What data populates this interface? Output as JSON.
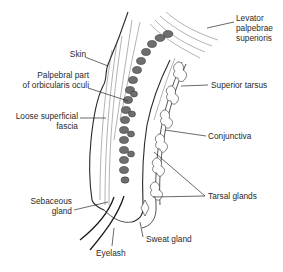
{
  "diagram": {
    "labels": {
      "skin": "Skin",
      "palpebral_part_line1": "Palpebral part",
      "palpebral_part_line2": "of orbicularis oculi",
      "loose_fascia_line1": "Loose superficial",
      "loose_fascia_line2": "fascia",
      "levator_line1": "Levator",
      "levator_line2": "palpebrae",
      "levator_line3": "superioris",
      "superior_tarsus": "Superior tarsus",
      "conjunctiva": "Conjunctiva",
      "tarsal_glands": "Tarsal glands",
      "sebaceous_line1": "Sebaceous",
      "sebaceous_line2": "gland",
      "sweat_gland": "Sweat gland",
      "eyelash": "Eyelash"
    },
    "colors": {
      "ink": "#2a2a2a",
      "background": "#ffffff",
      "muscle_fill": "#6e6e6e"
    }
  }
}
